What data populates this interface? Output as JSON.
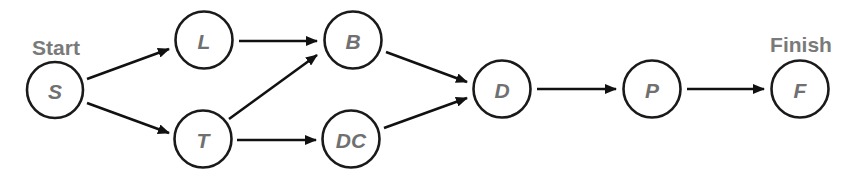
{
  "diagram": {
    "type": "activity-on-node network",
    "labels": {
      "start": "Start",
      "finish": "Finish"
    },
    "nodes": [
      {
        "id": "S",
        "label": "S",
        "cx": 55,
        "cy": 90
      },
      {
        "id": "L",
        "label": "L",
        "cx": 204,
        "cy": 40
      },
      {
        "id": "T",
        "label": "T",
        "cx": 203,
        "cy": 139
      },
      {
        "id": "B",
        "label": "B",
        "cx": 353,
        "cy": 40
      },
      {
        "id": "DC",
        "label": "DC",
        "cx": 351,
        "cy": 139
      },
      {
        "id": "D",
        "label": "D",
        "cx": 502,
        "cy": 89
      },
      {
        "id": "P",
        "label": "P",
        "cx": 652,
        "cy": 89
      },
      {
        "id": "F",
        "label": "F",
        "cx": 800,
        "cy": 89
      }
    ],
    "edges": [
      {
        "from": "S",
        "to": "L"
      },
      {
        "from": "S",
        "to": "T"
      },
      {
        "from": "L",
        "to": "B"
      },
      {
        "from": "T",
        "to": "B"
      },
      {
        "from": "T",
        "to": "DC"
      },
      {
        "from": "B",
        "to": "D"
      },
      {
        "from": "DC",
        "to": "D"
      },
      {
        "from": "D",
        "to": "P"
      },
      {
        "from": "P",
        "to": "F"
      }
    ],
    "colors": {
      "node_stroke": "#1a1a1a",
      "label_text": "#707070",
      "caption_text": "#7a7a7a",
      "edge": "#111111"
    }
  }
}
